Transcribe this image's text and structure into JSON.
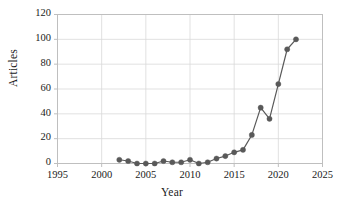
{
  "chart_data": {
    "type": "line",
    "title": "",
    "xlabel": "Year",
    "ylabel": "Articles",
    "xlim": [
      1995,
      2025
    ],
    "ylim": [
      0,
      120
    ],
    "xticks": [
      1995,
      2000,
      2005,
      2010,
      2015,
      2020,
      2025
    ],
    "yticks": [
      0,
      20,
      40,
      60,
      80,
      100,
      120
    ],
    "grid": "horizontal-and-vertical",
    "legend": "none",
    "marker": "circle",
    "series": [
      {
        "name": "Articles",
        "color": "#595959",
        "x": [
          2002,
          2003,
          2004,
          2005,
          2006,
          2007,
          2008,
          2009,
          2010,
          2011,
          2012,
          2013,
          2014,
          2015,
          2016,
          2017,
          2018,
          2019,
          2020,
          2021,
          2022
        ],
        "values": [
          3,
          2,
          0,
          0,
          0,
          2,
          1,
          1,
          3,
          0,
          1,
          4,
          6,
          9,
          11,
          23,
          45,
          36,
          64,
          92,
          100
        ]
      }
    ]
  },
  "axis": {
    "y_tick_labels": [
      "120",
      "100",
      "80",
      "60",
      "40",
      "20",
      "0"
    ],
    "x_tick_labels": [
      "1995",
      "2000",
      "2005",
      "2010",
      "2015",
      "2020",
      "2025"
    ],
    "y_title": "Articles",
    "x_title": "Year"
  },
  "colors": {
    "series": "#595959",
    "grid": "#d9d9d9",
    "frame": "#bfbfbf",
    "text": "#1a1a1a",
    "background": "#ffffff"
  }
}
